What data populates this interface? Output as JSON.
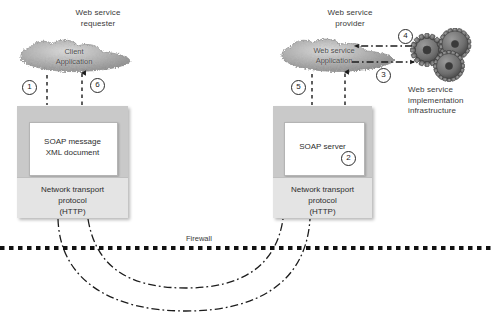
{
  "diagram": {
    "title_left": "Web service\nrequester",
    "title_right": "Web service\nprovider",
    "firewall_label": "Firewall",
    "infrastructure_label": "Web service\nimplementation\ninfrastructure",
    "left_cloud_text": "Client\nApplication",
    "right_cloud_text": "Web service\nApplication",
    "left_box": {
      "inner_text": "SOAP message\nXML document",
      "transport_text": "Network transport\nprotocol\n(HTTP)"
    },
    "right_box": {
      "inner_text": "SOAP server",
      "transport_text": "Network transport\nprotocol\n(HTTP)"
    },
    "steps": {
      "one": "1",
      "two": "2",
      "three": "3",
      "four": "4",
      "five": "5",
      "six": "6"
    },
    "colors": {
      "box_outer": "#c9c9c9",
      "box_transport": "#e4e4e4",
      "box_inner": "#ffffff",
      "line": "#1c1c1c",
      "cloud": "#a8a8a8",
      "gear": "#6e6e6e",
      "text": "#3a3a3a"
    }
  }
}
